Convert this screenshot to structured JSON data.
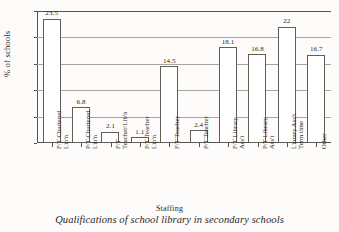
{
  "figure": {
    "caption": "Qualifications of school library in secondary schools",
    "x_axis_title": "Staffing",
    "y_axis_title": "% of schools"
  },
  "chart_data": {
    "type": "bar",
    "title": "Qualifications of school library in secondary schools",
    "xlabel": "Staffing",
    "ylabel": "% of schools",
    "ylim": [
      0,
      25
    ],
    "yticks": [
      0,
      5,
      10,
      15,
      20,
      25
    ],
    "ytick_labels": [
      "0",
      "5",
      "10",
      "15",
      "20",
      "25"
    ],
    "grid": true,
    "legend": "none",
    "categories": [
      "F/T Chartered Lib'n",
      "P/T Chartered Lib'n",
      "F/T Teacher/Lib'n",
      "P/T Teacher Lib'n",
      "F/T Teacher",
      "P/T Teacher",
      "F/T Library Ass't",
      "P/T Library Ass't",
      "Library Ass't Term time",
      "Other"
    ],
    "category_lines": [
      [
        "F/T Chartered",
        "Lib'n"
      ],
      [
        "P/T Chartered",
        "Lib'n"
      ],
      [
        "F/T",
        "Teacher/Lib'n"
      ],
      [
        "P/T Teacher",
        "Lib'n"
      ],
      [
        "F/T Teacher",
        ""
      ],
      [
        "P/T Teacher",
        ""
      ],
      [
        "F/T Library",
        "Ass't"
      ],
      [
        "P/T Library",
        "Ass't"
      ],
      [
        "Library Ass't",
        "Term time"
      ],
      [
        "Other",
        ""
      ]
    ],
    "values": [
      23.5,
      6.8,
      2.1,
      1.1,
      14.5,
      2.4,
      18.1,
      16.8,
      22,
      16.7
    ],
    "value_labels": [
      "23.5",
      "6.8",
      "2.1",
      "1.1",
      "14.5",
      "2.4",
      "18.1",
      "16.8",
      "22",
      "16.7"
    ],
    "colors": {
      "bar_fill": "#ffffff",
      "bar_edge": "#615d58",
      "grid": "#a8a49f",
      "axis": "#56524e",
      "text": "#2b2724",
      "background": "#fdfcfa"
    }
  }
}
